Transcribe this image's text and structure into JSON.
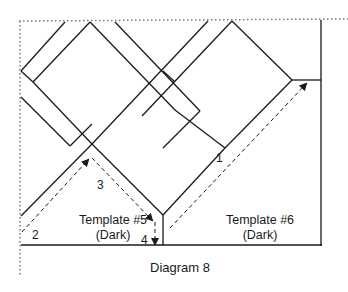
{
  "diagram": {
    "caption": "Diagram 8",
    "templates": [
      {
        "name": "Template #5",
        "shade": "(Dark)"
      },
      {
        "name": "Template #6",
        "shade": "(Dark)"
      }
    ],
    "steps": [
      {
        "label": "1"
      },
      {
        "label": "2"
      },
      {
        "label": "3"
      },
      {
        "label": "4"
      }
    ],
    "colors": {
      "line": "#1a1a1a",
      "dotted": "#777777",
      "background": "#ffffff"
    }
  }
}
